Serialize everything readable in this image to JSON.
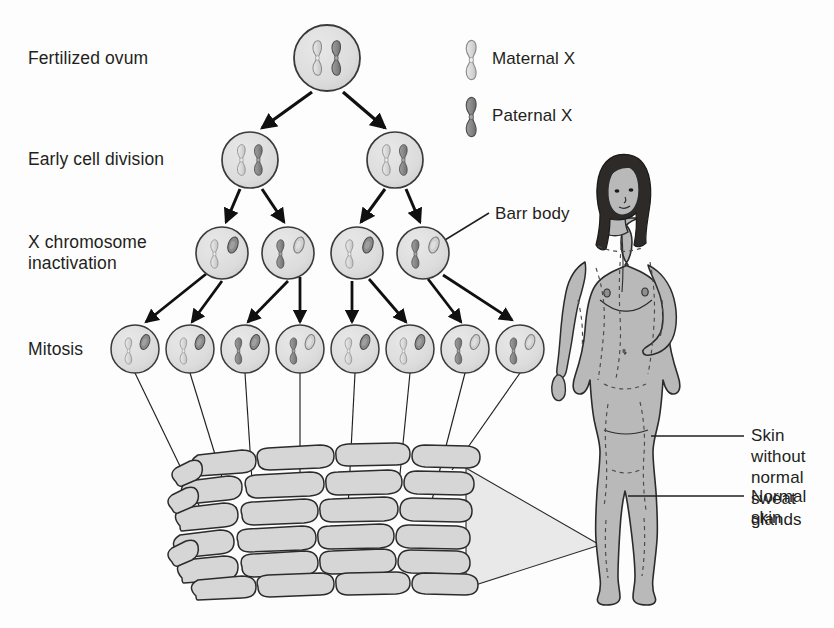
{
  "diagram": {
    "background_color": "#fdfdfd",
    "ink_color": "#231f20"
  },
  "stage_labels": {
    "fertilized_ovum": "Fertilized ovum",
    "early_cell_division": "Early cell division",
    "x_inactivation": "X chromosome\ninactivation",
    "mitosis": "Mitosis"
  },
  "legend": {
    "items": [
      {
        "label": "Maternal X",
        "color": "#d9d9d9",
        "stroke": "#8c8c8c",
        "icon": "chromosome-icon"
      },
      {
        "label": "Paternal X",
        "color": "#8a8a8a",
        "stroke": "#5a5a5a",
        "icon": "chromosome-icon"
      }
    ]
  },
  "callouts": {
    "barr_body": "Barr body",
    "skin_without_glands": "Skin without\nnormal sweat\nglands",
    "normal_skin": "Normal skin"
  },
  "colors": {
    "maternal_x": "#d9d9d9",
    "paternal_x": "#8a8a8a",
    "maternal_stroke": "#8c8c8c",
    "paternal_stroke": "#555555",
    "cell_fill": "#dcdcdc",
    "cell_stroke": "#3a3a3a",
    "skin_cell_fill": "#d5d5d5",
    "skin_cell_stroke": "#2b2b2b",
    "body_fill": "#b9b9b9",
    "body_stroke": "#2b2b2b",
    "hair_fill": "#2e2a28",
    "cone_fill": "#e6e6e6",
    "arrow": "#101010",
    "leader_line": "#231f20"
  },
  "rows": {
    "ovum": {
      "y": 58,
      "cells": [
        {
          "cx": 327,
          "r": 33,
          "left_chromosome": "maternal",
          "right_chromosome": "paternal",
          "barr_body": false
        }
      ]
    },
    "early_division": {
      "y": 160,
      "cells": [
        {
          "cx": 250,
          "r": 28,
          "left_chromosome": "maternal",
          "right_chromosome": "paternal",
          "barr_body": false
        },
        {
          "cx": 395,
          "r": 28,
          "left_chromosome": "maternal",
          "right_chromosome": "paternal",
          "barr_body": false
        }
      ]
    },
    "inactivation": {
      "y": 253,
      "cells": [
        {
          "cx": 222,
          "r": 26,
          "active": "maternal",
          "inactive": "paternal",
          "barr_body": true
        },
        {
          "cx": 288,
          "r": 26,
          "active": "paternal",
          "inactive": "maternal",
          "barr_body": true
        },
        {
          "cx": 357,
          "r": 26,
          "active": "maternal",
          "inactive": "paternal",
          "barr_body": true
        },
        {
          "cx": 423,
          "r": 26,
          "active": "paternal",
          "inactive": "maternal",
          "barr_body": true
        }
      ]
    },
    "mitosis": {
      "y": 349,
      "cells": [
        {
          "cx": 135,
          "r": 24,
          "active": "maternal",
          "inactive": "paternal",
          "barr_body": true
        },
        {
          "cx": 190,
          "r": 24,
          "active": "maternal",
          "inactive": "paternal",
          "barr_body": true
        },
        {
          "cx": 245,
          "r": 24,
          "active": "paternal",
          "inactive": "maternal",
          "barr_body": true
        },
        {
          "cx": 300,
          "r": 24,
          "active": "paternal",
          "inactive": "maternal",
          "barr_body": true
        },
        {
          "cx": 355,
          "r": 24,
          "active": "maternal",
          "inactive": "paternal",
          "barr_body": true
        },
        {
          "cx": 410,
          "r": 24,
          "active": "maternal",
          "inactive": "paternal",
          "barr_body": true
        },
        {
          "cx": 465,
          "r": 24,
          "active": "paternal",
          "inactive": "maternal",
          "barr_body": true
        },
        {
          "cx": 520,
          "r": 24,
          "active": "paternal",
          "inactive": "maternal",
          "barr_body": true
        }
      ]
    }
  },
  "skin_block": {
    "x": 175,
    "y": 455,
    "width": 290,
    "height": 140,
    "cell_rows": 6,
    "description": "block of epidermal cells magnified from the leg"
  },
  "figure": {
    "x": 545,
    "y": 200,
    "width": 140,
    "height": 410
  }
}
